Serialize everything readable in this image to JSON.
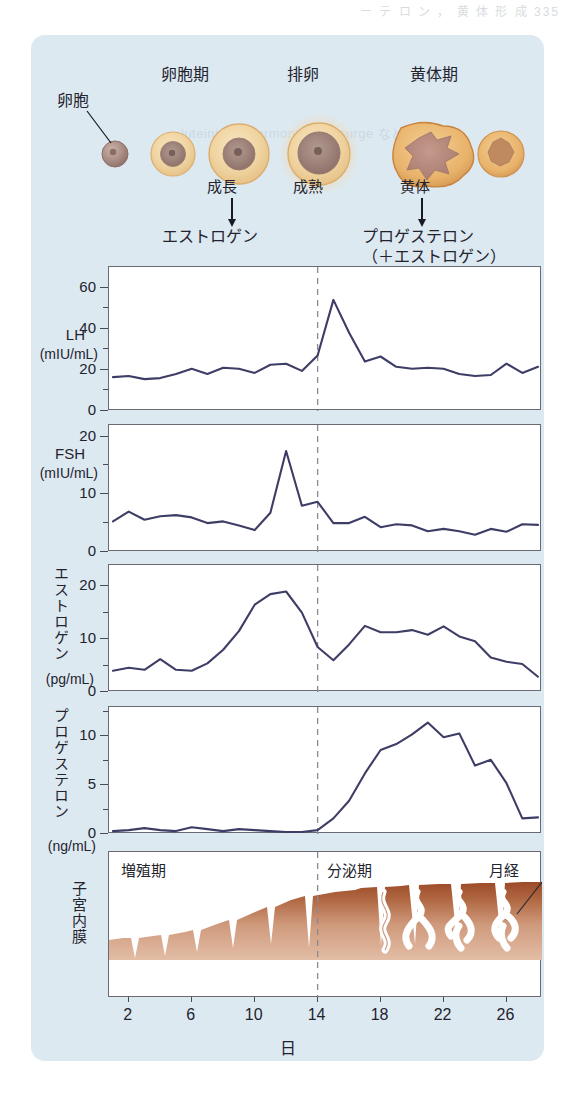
{
  "page": {
    "bleed_top": "ー テ ロ ン ，  黄 体 形 成  335",
    "bleed_mid": "luteinizing hormone (LH) surge などと"
  },
  "phases": {
    "follicular": "卵胞期",
    "ovulation": "排卵",
    "luteal": "黄体期"
  },
  "ovary": {
    "ovum_label": "卵胞",
    "growth_label": "成長",
    "mature_label": "成熟",
    "corpus_luteum_label": "黄体",
    "estrogen_arrow_label": "エストロゲン",
    "progesterone_arrow_label": "プロゲステロン",
    "progesterone_arrow_sublabel": "（＋エストロゲン）"
  },
  "axis": {
    "x_title": "日",
    "x_ticks": [
      2,
      6,
      10,
      14,
      18,
      22,
      26
    ],
    "x_min": 1,
    "x_max": 28
  },
  "colors": {
    "card_background": "#dde9f1",
    "plot_line": "#3d3d66",
    "panel_border": "#6a6a72",
    "ovulation_line": "#8a8a95",
    "endometrium_dark": "#9c4a28",
    "endometrium_light": "#e0b59c",
    "follicle_outer": "#edc98f",
    "ovum_core": "#a98d84"
  },
  "chart_data": [
    {
      "type": "line",
      "title": "LH",
      "ylabel": "LH",
      "yunit": "(mIU/mL)",
      "xlabel": "日",
      "ylim": [
        0,
        70
      ],
      "yticks": [
        0,
        20,
        40,
        60
      ],
      "yminor": [
        10,
        30,
        50
      ],
      "grid": false,
      "x": [
        1,
        2,
        3,
        4,
        5,
        6,
        7,
        8,
        9,
        10,
        11,
        12,
        13,
        14,
        15,
        16,
        17,
        18,
        19,
        20,
        21,
        22,
        23,
        24,
        25,
        26,
        27,
        28
      ],
      "values": [
        16.5,
        17,
        15.5,
        16,
        18,
        20.5,
        18,
        21,
        20.5,
        18.5,
        22.5,
        23,
        19.5,
        27,
        54,
        38,
        24,
        26.5,
        21.5,
        20.5,
        21,
        20.5,
        18,
        17,
        17.5,
        23,
        18.5,
        21.5
      ]
    },
    {
      "type": "line",
      "title": "FSH",
      "ylabel": "FSH",
      "yunit": "(mIU/mL)",
      "xlabel": "日",
      "ylim": [
        0,
        22
      ],
      "yticks": [
        0,
        10,
        20
      ],
      "yminor": [
        5,
        15
      ],
      "grid": false,
      "x": [
        1,
        2,
        3,
        4,
        5,
        6,
        7,
        8,
        9,
        10,
        11,
        12,
        13,
        14,
        15,
        16,
        17,
        18,
        19,
        20,
        21,
        22,
        23,
        24,
        25,
        26,
        27,
        28
      ],
      "values": [
        5.3,
        7.0,
        5.6,
        6.2,
        6.4,
        6.0,
        5.0,
        5.3,
        4.6,
        3.8,
        6.8,
        17.5,
        8.0,
        8.7,
        5.0,
        5.0,
        6.1,
        4.3,
        4.8,
        4.6,
        3.6,
        4.0,
        3.6,
        3.0,
        4.0,
        3.5,
        4.8,
        4.7
      ]
    },
    {
      "type": "line",
      "title": "エストロゲン",
      "ylabel": "エストロゲン",
      "yunit": "(pg/mL)",
      "xlabel": "日",
      "ylim": [
        0,
        24
      ],
      "yticks": [
        0,
        10,
        20
      ],
      "yminor": [
        5,
        15
      ],
      "grid": false,
      "x": [
        1,
        2,
        3,
        4,
        5,
        6,
        7,
        8,
        9,
        10,
        11,
        12,
        13,
        14,
        15,
        16,
        17,
        18,
        19,
        20,
        21,
        22,
        23,
        24,
        25,
        26,
        27,
        28
      ],
      "values": [
        4.0,
        4.6,
        4.2,
        6.2,
        4.2,
        4.0,
        5.4,
        8.0,
        11.5,
        16.5,
        18.5,
        19.0,
        15.0,
        8.5,
        6.0,
        9.0,
        12.5,
        11.3,
        11.3,
        11.7,
        10.8,
        12.4,
        10.5,
        9.6,
        6.5,
        5.7,
        5.3,
        2.9
      ]
    },
    {
      "type": "line",
      "title": "プロゲステロン",
      "ylabel": "プロゲステロン",
      "yunit": "(ng/mL)",
      "xlabel": "日",
      "ylim": [
        0,
        13
      ],
      "yticks": [
        0,
        5,
        10
      ],
      "yminor": [
        2.5,
        7.5,
        12.5
      ],
      "grid": false,
      "x": [
        1,
        2,
        3,
        4,
        5,
        6,
        7,
        8,
        9,
        10,
        11,
        12,
        13,
        14,
        15,
        16,
        17,
        18,
        19,
        20,
        21,
        22,
        23,
        24,
        25,
        26,
        27,
        28
      ],
      "values": [
        0.3,
        0.4,
        0.6,
        0.4,
        0.3,
        0.7,
        0.5,
        0.3,
        0.5,
        0.4,
        0.3,
        0.2,
        0.2,
        0.4,
        1.6,
        3.4,
        6.2,
        8.6,
        9.2,
        10.2,
        11.4,
        9.9,
        10.3,
        7.0,
        7.6,
        5.2,
        1.6,
        1.7
      ]
    }
  ],
  "endometrium": {
    "ylabel": "子宮内膜",
    "proliferative_label": "増殖期",
    "secretory_label": "分泌期",
    "menstruation_label": "月経"
  }
}
